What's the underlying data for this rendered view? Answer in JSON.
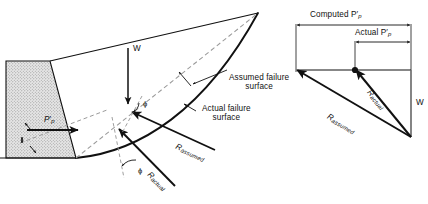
{
  "figure": {
    "title_semantic": "passive-earth-pressure-failure-surface-and-force-polygon",
    "colors": {
      "ink": "#1a1a1a",
      "solid_line": "#111111",
      "dashed_line": "#9a9a9a",
      "wall_fill": "#d9d9d9",
      "background": "#ffffff"
    }
  },
  "left_panel": {
    "name": "soil-profile-diagram",
    "wall": {
      "label": "retaining-wall-stippled",
      "fill_note": "stippled"
    },
    "labels": {
      "weight": "W",
      "passive_pressure": "P",
      "passive_pressure_sub": "p",
      "passive_pressure_prime": "′",
      "assumed_surface_line1": "Assumed failure",
      "assumed_surface_line2": "surface",
      "actual_surface_line1": "Actual failure",
      "actual_surface_line2": "surface",
      "r_assumed_main": "R",
      "r_assumed_sub": "assumed",
      "r_actual_main": "R",
      "r_actual_sub": "actual",
      "phi_upper": "ϕ",
      "phi_lower": "ϕ"
    }
  },
  "right_panel": {
    "name": "force-polygon-diagram",
    "dimensions": [
      {
        "name": "computed-pp-dimension",
        "text": "Computed P",
        "sub": "p",
        "prime": "′"
      },
      {
        "name": "actual-pp-dimension",
        "text": "Actual P",
        "sub": "p",
        "prime": "′"
      }
    ],
    "vectors": [
      {
        "name": "weight-vector",
        "label": "W"
      },
      {
        "name": "r-actual-vector",
        "main": "R",
        "sub": "actual"
      },
      {
        "name": "r-assumed-vector",
        "main": "R",
        "sub": "assumed"
      }
    ]
  }
}
